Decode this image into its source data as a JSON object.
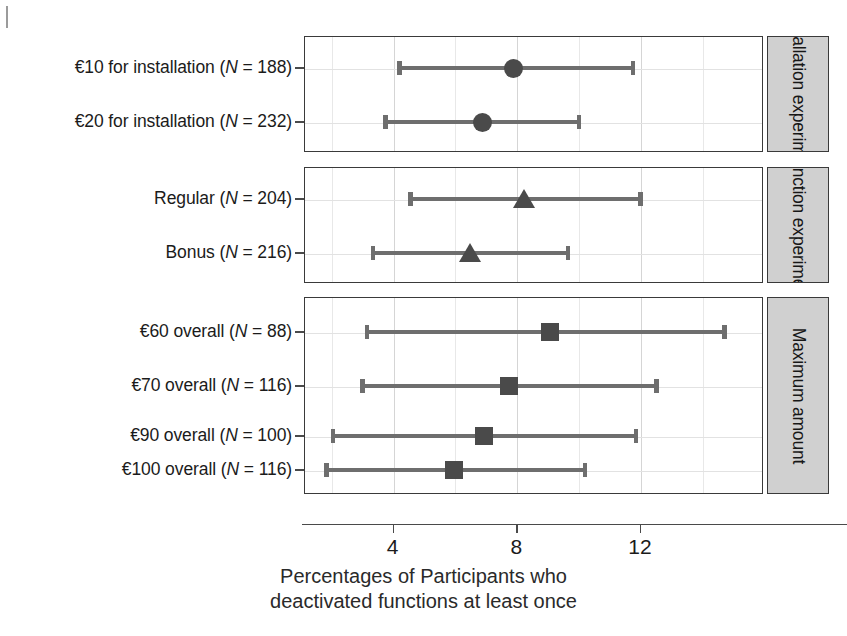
{
  "chart_data": {
    "type": "scatter",
    "title": "",
    "xlabel": "Percentages of Participants who deactivated functions at least once",
    "xlabel_line1": "Percentages of Participants who",
    "xlabel_line2": "deactivated functions at least once",
    "ylabel": "",
    "xlim": [
      1.2,
      15.6
    ],
    "xticks": [
      4,
      8,
      12
    ],
    "xticklabels": [
      "4",
      "8",
      "12"
    ],
    "grid": true,
    "grid_axis": "both",
    "legend": "none",
    "orientation": "horizontal",
    "note": "Point estimates with 95% confidence interval whiskers, grouped into three facet panels labelled on the right.",
    "panels": [
      {
        "strip_label": "Installation experiment",
        "marker": "circle",
        "rows": [
          {
            "label_prefix": "€10 for installation (",
            "label_italic": "N",
            "label_suffix": " = 188)",
            "label_full": "€10 for installation (N = 188)",
            "value": 7.9,
            "ci_low": 4.15,
            "ci_high": 11.85
          },
          {
            "label_prefix": "€20 for installation (",
            "label_italic": "N",
            "label_suffix": " = 232)",
            "label_full": "€20 for installation (N = 232)",
            "value": 6.9,
            "ci_low": 3.7,
            "ci_high": 10.1
          }
        ]
      },
      {
        "strip_label": "Function experiment",
        "marker": "triangle",
        "rows": [
          {
            "label_prefix": "Regular (",
            "label_italic": "N",
            "label_suffix": " = 204)",
            "label_full": "Regular (N = 204)",
            "value": 8.25,
            "ci_low": 4.5,
            "ci_high": 12.1
          },
          {
            "label_prefix": "Bonus (",
            "label_italic": "N",
            "label_suffix": " = 216)",
            "label_full": "Bonus (N = 216)",
            "value": 6.5,
            "ci_low": 3.3,
            "ci_high": 9.75
          }
        ]
      },
      {
        "strip_label": "Maximum amount",
        "marker": "square",
        "rows": [
          {
            "label_prefix": "€60 overall (",
            "label_italic": "N",
            "label_suffix": " = 88)",
            "label_full": "€60 overall (N = 88)",
            "value": 9.1,
            "ci_low": 3.1,
            "ci_high": 14.8
          },
          {
            "label_prefix": "€70 overall (",
            "label_italic": "N",
            "label_suffix": " = 116)",
            "label_full": "€70 overall (N = 116)",
            "value": 7.75,
            "ci_low": 2.95,
            "ci_high": 12.6
          },
          {
            "label_prefix": "€90 overall (",
            "label_italic": "N",
            "label_suffix": " = 100)",
            "label_full": "€90 overall (N = 100)",
            "value": 6.95,
            "ci_low": 2.0,
            "ci_high": 11.95
          },
          {
            "label_prefix": "€100 overall (",
            "label_italic": "N",
            "label_suffix": " = 116)",
            "label_full": "€100 overall (N = 116)",
            "value": 6.0,
            "ci_low": 1.8,
            "ci_high": 10.3
          }
        ]
      }
    ]
  },
  "colors": {
    "marker": "#4a4a4a",
    "whisker": "#6e6e6e",
    "panel_border": "#3a3a3a",
    "strip_fill": "#d0d0d0",
    "grid": "#d8d8d8",
    "text": "#1b1b1b",
    "background": "#ffffff"
  }
}
